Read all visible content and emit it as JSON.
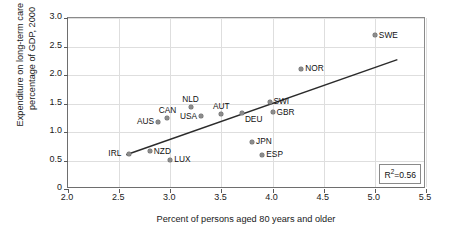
{
  "chart_data": {
    "type": "scatter",
    "title": "",
    "xlabel": "Percent of persons aged 80 years and older",
    "ylabel": "Expenditure on long-term care as\npercentage of GDP, 2000",
    "xlim": [
      2.0,
      5.5
    ],
    "ylim": [
      0,
      3.0
    ],
    "xticks": [
      "2.0",
      "2.5",
      "3.0",
      "3.5",
      "4.0",
      "4.5",
      "5.0",
      "5.5"
    ],
    "xtick_values": [
      2.0,
      2.5,
      3.0,
      3.5,
      4.0,
      4.5,
      5.0,
      5.5
    ],
    "yticks": [
      "0",
      "0.5",
      "1.0",
      "1.5",
      "2.0",
      "2.5",
      "3.0"
    ],
    "ytick_values": [
      0,
      0.5,
      1.0,
      1.5,
      2.0,
      2.5,
      3.0
    ],
    "grid": true,
    "legend": "none",
    "annotation": "R2=0.56",
    "r_squared": 0.56,
    "trendline": {
      "type": "linear",
      "x_start": 2.57,
      "y_start": 0.6,
      "x_end": 5.22,
      "y_end": 2.27
    },
    "points": [
      {
        "label": "SWE",
        "x": 5.0,
        "y": 2.7,
        "label_pos": "right"
      },
      {
        "label": "NOR",
        "x": 4.28,
        "y": 2.11,
        "label_pos": "right"
      },
      {
        "label": "SWI",
        "x": 3.97,
        "y": 1.53,
        "label_pos": "right"
      },
      {
        "label": "NLD",
        "x": 3.2,
        "y": 1.43,
        "label_pos": "above"
      },
      {
        "label": "GBR",
        "x": 4.0,
        "y": 1.35,
        "label_pos": "right"
      },
      {
        "label": "DEU",
        "x": 3.7,
        "y": 1.33,
        "label_pos": "belowright"
      },
      {
        "label": "AUT",
        "x": 3.5,
        "y": 1.31,
        "label_pos": "above"
      },
      {
        "label": "USA",
        "x": 3.3,
        "y": 1.28,
        "label_pos": "left"
      },
      {
        "label": "CAN",
        "x": 2.97,
        "y": 1.24,
        "label_pos": "above"
      },
      {
        "label": "AUS",
        "x": 2.88,
        "y": 1.18,
        "label_pos": "left"
      },
      {
        "label": "JPN",
        "x": 3.8,
        "y": 0.83,
        "label_pos": "right"
      },
      {
        "label": "NZD",
        "x": 2.8,
        "y": 0.66,
        "label_pos": "right"
      },
      {
        "label": "IRL",
        "x": 2.6,
        "y": 0.62,
        "label_pos": "left"
      },
      {
        "label": "ESP",
        "x": 3.9,
        "y": 0.6,
        "label_pos": "right"
      },
      {
        "label": "LUX",
        "x": 3.0,
        "y": 0.51,
        "label_pos": "right"
      }
    ]
  }
}
